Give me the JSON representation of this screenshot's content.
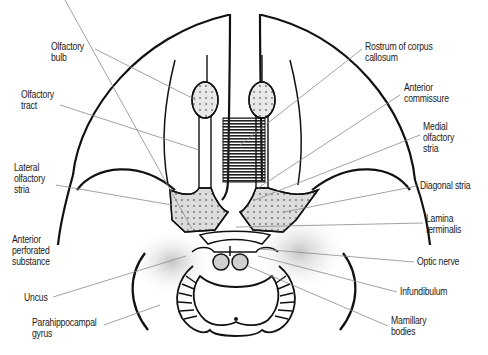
{
  "diagram": {
    "title": "",
    "labels_left": [
      {
        "id": "olfactory-bulb",
        "text": "Olfactory\nbulb",
        "x": 51,
        "y": 41
      },
      {
        "id": "olfactory-tract",
        "text": "Olfactory\ntract",
        "x": 21,
        "y": 89
      },
      {
        "id": "lateral-olfactory-stria",
        "text": "Lateral\nolfactory\nstria",
        "x": 14,
        "y": 162
      },
      {
        "id": "anterior-perforated-substance",
        "text": "Anterior\nperforated\nsubstance",
        "x": 12,
        "y": 234
      },
      {
        "id": "uncus",
        "text": "Uncus",
        "x": 24,
        "y": 292
      },
      {
        "id": "parahippocampal-gyrus",
        "text": "Parahippocampal\ngyrus",
        "x": 32,
        "y": 317
      }
    ],
    "labels_right": [
      {
        "id": "rostrum-of-corpus-callosum",
        "text": "Rostrum of corpus\ncallosum",
        "x": 365,
        "y": 41
      },
      {
        "id": "anterior-commissure",
        "text": "Anterior\ncommissure",
        "x": 404,
        "y": 82
      },
      {
        "id": "medial-olfactory-stria",
        "text": "Medial\nolfactory\nstria",
        "x": 423,
        "y": 121
      },
      {
        "id": "diagonal-stria",
        "text": "Diagonal stria",
        "x": 420,
        "y": 180
      },
      {
        "id": "lamina-terminalis",
        "text": "Lamina\nterminalis",
        "x": 426,
        "y": 213
      },
      {
        "id": "optic-nerve",
        "text": "Optic nerve",
        "x": 417,
        "y": 256
      },
      {
        "id": "infundibulum",
        "text": "Infundibulum",
        "x": 400,
        "y": 286
      },
      {
        "id": "mamillary-bodies",
        "text": "Mamillary\nbodies",
        "x": 391,
        "y": 315
      }
    ],
    "colors": {
      "outline": "#111111",
      "leader": "#8a8a8a",
      "shade": "#c8c8c8",
      "rostrum": "#222222"
    }
  }
}
